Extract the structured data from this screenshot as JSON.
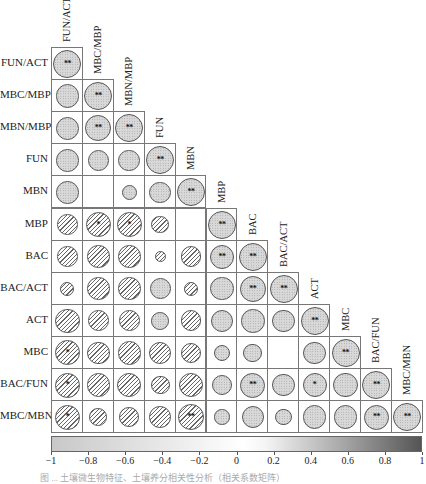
{
  "chart_data": {
    "type": "heatmap",
    "subtype": "correlation-matrix-lower-triangle-circles",
    "title": "",
    "variables": [
      "FUN/ACT",
      "MBC/MBP",
      "MBN/MBP",
      "FUN",
      "MBN",
      "MBP",
      "BAC",
      "BAC/ACT",
      "ACT",
      "MBC",
      "BAC/FUN",
      "MBC/MBN"
    ],
    "matrix": [
      [
        1
      ],
      [
        0.7,
        1
      ],
      [
        0.7,
        0.85,
        1
      ],
      [
        0.65,
        0.55,
        0.6,
        1
      ],
      [
        0.65,
        0,
        0.3,
        0.6,
        1
      ],
      [
        -0.55,
        -0.8,
        -0.8,
        -0.4,
        0,
        1
      ],
      [
        -0.55,
        -0.65,
        -0.65,
        -0.15,
        -0.55,
        0.75,
        1
      ],
      [
        -0.25,
        -0.65,
        -0.65,
        0.55,
        -0.25,
        0.7,
        0.85,
        1
      ],
      [
        -0.75,
        -0.55,
        -0.55,
        0.4,
        -0.55,
        0.65,
        0.7,
        0.65,
        1
      ],
      [
        -0.8,
        -0.65,
        -0.7,
        -0.65,
        -0.55,
        0.35,
        0.45,
        0,
        0.65,
        1
      ],
      [
        -0.8,
        -0.7,
        -0.75,
        -0.45,
        -0.75,
        0.55,
        0.8,
        0.65,
        0.75,
        0.75,
        1
      ],
      [
        -0.8,
        -0.4,
        -0.5,
        -0.6,
        -0.85,
        0.3,
        0.65,
        0.35,
        0.7,
        0.7,
        0.8,
        1
      ]
    ],
    "significance": [
      [
        "**"
      ],
      [
        "",
        "**"
      ],
      [
        "",
        "**",
        "**"
      ],
      [
        "",
        "",
        "",
        "**"
      ],
      [
        "",
        "",
        "",
        "",
        "**"
      ],
      [
        "",
        "*",
        "*",
        "",
        "",
        "**"
      ],
      [
        "",
        "",
        "",
        "",
        "",
        "**",
        "**"
      ],
      [
        "",
        "",
        "",
        "",
        "",
        "",
        "**",
        "**"
      ],
      [
        "",
        "",
        "",
        "",
        "",
        "",
        "",
        "",
        "**"
      ],
      [
        "*",
        "",
        "",
        "",
        "",
        "",
        "",
        "",
        "",
        "**"
      ],
      [
        "*",
        "",
        "",
        "",
        "",
        "",
        "**",
        "",
        "*",
        "",
        "**"
      ],
      [
        "*",
        "",
        "",
        "",
        "**",
        "",
        "",
        "",
        "",
        "",
        "**",
        "**"
      ]
    ],
    "legend": {
      "type": "colorbar",
      "range": [
        -1,
        1
      ],
      "ticks": [
        "-1",
        "-0.8",
        "-0.6",
        "-0.4",
        "-0.2",
        "0",
        "0.2",
        "0.4",
        "0.6",
        "0.8",
        "1"
      ],
      "position": "bottom",
      "positive_fill": "dotted gray",
      "negative_fill": "diagonal hatch"
    },
    "xlabel": "",
    "ylabel": "",
    "grid": true
  },
  "colors": {
    "cell_border": "#777777",
    "circle_border": "#555555",
    "positive_fill": "#d9d9d9",
    "colorbar_low": "#c8c8c8",
    "colorbar_mid": "#ffffff",
    "colorbar_high": "#555555"
  },
  "caption": "图 ... 土壤微生物特征、土壤养分相关性分析（相关系数矩阵）"
}
